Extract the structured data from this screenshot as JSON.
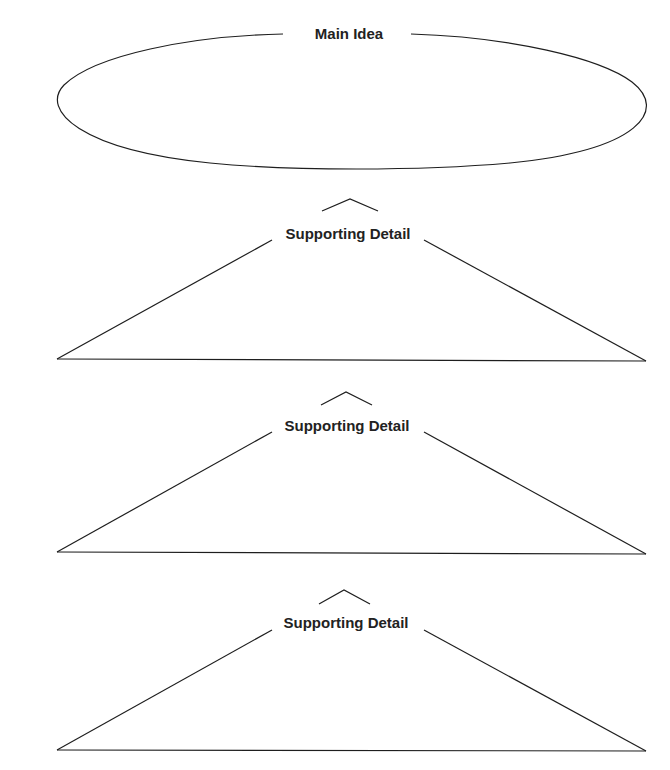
{
  "diagram": {
    "type": "main-idea-supporting-details organizer",
    "main_idea": {
      "label": "Main Idea"
    },
    "supporting_details": [
      {
        "label": "Supporting Detail"
      },
      {
        "label": "Supporting Detail"
      },
      {
        "label": "Supporting Detail"
      }
    ]
  },
  "colors": {
    "stroke": "#1e1e1e",
    "text": "#222222",
    "background": "#ffffff"
  }
}
